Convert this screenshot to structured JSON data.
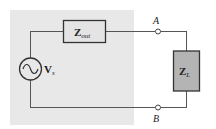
{
  "diagram": {
    "type": "thevenin-equivalent-circuit",
    "colors": {
      "source_region": "#e8e8e8",
      "wire": "#555555",
      "zout_fill": "#e4e4e4",
      "zl_fill": "#b4b4b4",
      "stroke": "#333333"
    },
    "source": {
      "label_main": "V",
      "label_sub": "s",
      "symbol": "ac-voltage-source-icon"
    },
    "output_impedance": {
      "label_main": "Z",
      "label_sub": "out"
    },
    "load_impedance": {
      "label_main": "Z",
      "label_sub": "L"
    },
    "terminals": [
      {
        "id": "A",
        "label": "A"
      },
      {
        "id": "B",
        "label": "B"
      }
    ]
  }
}
